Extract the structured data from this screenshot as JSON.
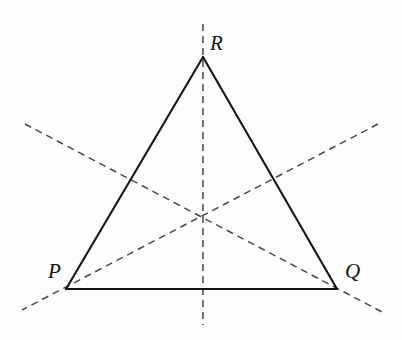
{
  "figure": {
    "kind": "geometry-diagram",
    "background_color": "#fdfdfc",
    "canvas": {
      "width": 402,
      "height": 340
    }
  },
  "style": {
    "solid_stroke_color": "#141414",
    "solid_stroke_width": 2.1,
    "dashed_stroke_color": "#4a4a4a",
    "dashed_stroke_width": 1.5,
    "dash_pattern": "7 5",
    "label_color": "#141414",
    "label_font_size": 21
  },
  "vertices": [
    {
      "id": "P",
      "label": "P",
      "x": 66,
      "y": 289,
      "label_x": 48,
      "label_y": 261
    },
    {
      "id": "Q",
      "label": "Q",
      "x": 337,
      "y": 289,
      "label_x": 345,
      "label_y": 261
    },
    {
      "id": "R",
      "label": "R",
      "x": 203,
      "y": 57,
      "label_x": 210,
      "label_y": 33
    }
  ],
  "centroid": {
    "x": 203,
    "y": 216
  },
  "edges": [
    {
      "id": "edge-PR",
      "from": "P",
      "to": "R",
      "x1": 66,
      "y1": 289,
      "x2": 203,
      "y2": 57
    },
    {
      "id": "edge-RQ",
      "from": "R",
      "to": "Q",
      "x1": 203,
      "y1": 57,
      "x2": 337,
      "y2": 289
    },
    {
      "id": "edge-PQ",
      "from": "P",
      "to": "Q",
      "x1": 66,
      "y1": 289,
      "x2": 337,
      "y2": 289
    }
  ],
  "dashed_lines": [
    {
      "id": "axis-vertical",
      "through": "R",
      "x1": 203,
      "y1": 24,
      "x2": 203,
      "y2": 325
    },
    {
      "id": "axis-from-upper-left",
      "through": "Q",
      "x1": 25,
      "y1": 124,
      "x2": 382,
      "y2": 312
    },
    {
      "id": "axis-from-upper-right",
      "through": "P",
      "x1": 378,
      "y1": 124,
      "x2": 22,
      "y2": 310
    }
  ],
  "labels": {
    "R": "R",
    "P": "P",
    "Q": "Q"
  }
}
